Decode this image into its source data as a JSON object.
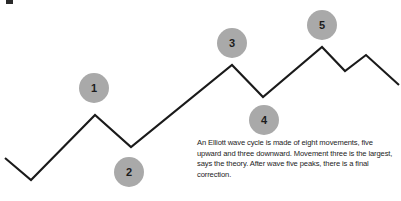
{
  "figure": {
    "name": "elliott-wave-cycle-diagram",
    "background_color": "#ffffff",
    "line_color": "#1a1a1a",
    "marker_fill_color": "#a9a9a9",
    "marker_text_color": "#1c1c1c",
    "caption_text_color": "#232323"
  },
  "markers": [
    {
      "label": "1",
      "cx": 94,
      "cy": 88
    },
    {
      "label": "2",
      "cx": 129,
      "cy": 172
    },
    {
      "label": "3",
      "cx": 232,
      "cy": 43
    },
    {
      "label": "4",
      "cx": 264,
      "cy": 120
    },
    {
      "label": "5",
      "cx": 322,
      "cy": 25
    }
  ],
  "caption": {
    "text": "An Elliott wave cycle is made of eight movements, five upward and three downward. Movement three is the largest, says the theory. After wave five peaks, there is a final correction."
  },
  "chart_data": {
    "type": "line",
    "title": "",
    "xlabel": "",
    "ylabel": "",
    "grid": false,
    "legend": "none",
    "annotations": [
      "1",
      "2",
      "3",
      "4",
      "5"
    ],
    "points": [
      {
        "x": 5,
        "y": 158
      },
      {
        "x": 31,
        "y": 180
      },
      {
        "x": 95,
        "y": 115
      },
      {
        "x": 131,
        "y": 147
      },
      {
        "x": 232,
        "y": 65
      },
      {
        "x": 263,
        "y": 97
      },
      {
        "x": 322,
        "y": 47
      },
      {
        "x": 345,
        "y": 71
      },
      {
        "x": 366,
        "y": 55
      },
      {
        "x": 399,
        "y": 85
      }
    ]
  }
}
